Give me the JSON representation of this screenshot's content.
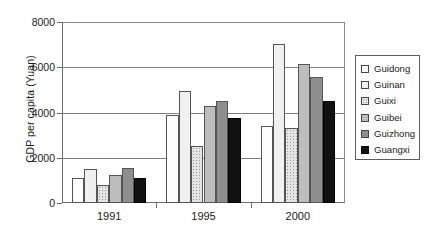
{
  "chart_data": {
    "type": "bar",
    "title": "",
    "subtitle": "",
    "xlabel": "",
    "ylabel": "GDP per capita (Yuan)",
    "categories": [
      "1991",
      "1995",
      "2000"
    ],
    "yticks": [
      0,
      2000,
      4000,
      6000,
      8000
    ],
    "ylim": [
      0,
      8000
    ],
    "grid": true,
    "legend_position": "right",
    "series": [
      {
        "name": "Guidong",
        "swatch": "f0",
        "values": [
          1100,
          3880,
          3400
        ]
      },
      {
        "name": "Guinan",
        "swatch": "f1",
        "values": [
          1500,
          4950,
          7050
        ]
      },
      {
        "name": "Guixi",
        "swatch": "f2",
        "values": [
          800,
          2500,
          3300
        ]
      },
      {
        "name": "Guibei",
        "swatch": "f3",
        "values": [
          1250,
          4300,
          6150
        ]
      },
      {
        "name": "Guizhong",
        "swatch": "f4",
        "values": [
          1530,
          4520,
          5550
        ]
      },
      {
        "name": "Guangxi",
        "swatch": "f5",
        "values": [
          1120,
          3750,
          4520
        ]
      }
    ]
  }
}
